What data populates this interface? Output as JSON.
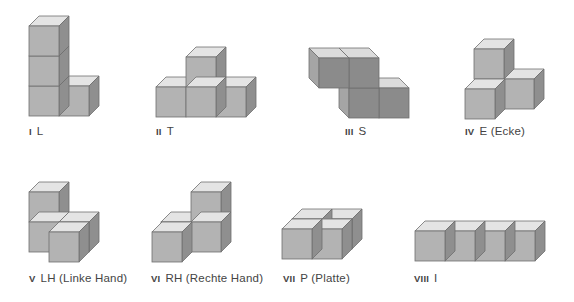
{
  "figure": {
    "title": "",
    "colors": {
      "front": "#b3b3b3",
      "top": "#e4e4e4",
      "side": "#8f8f8f",
      "edge": "#6f6f6f",
      "front_dark": "#8b8b8b",
      "top_dark": "#dcdcdc",
      "side_dark": "#a5a5a5"
    },
    "pieces": [
      {
        "numeral": "I",
        "name": "L",
        "label_x": 29,
        "label_y": 125
      },
      {
        "numeral": "II",
        "name": "T",
        "label_x": 156,
        "label_y": 125
      },
      {
        "numeral": "III",
        "name": "S",
        "label_x": 345,
        "label_y": 125
      },
      {
        "numeral": "IV",
        "name": "E (Ecke)",
        "label_x": 465,
        "label_y": 125
      },
      {
        "numeral": "V",
        "name": "LH (Linke Hand)",
        "label_x": 29,
        "label_y": 272
      },
      {
        "numeral": "VI",
        "name": "RH (Rechte Hand)",
        "label_x": 151,
        "label_y": 272
      },
      {
        "numeral": "VII",
        "name": "P (Platte)",
        "label_x": 283,
        "label_y": 272
      },
      {
        "numeral": "VIII",
        "name": "I",
        "label_x": 414,
        "label_y": 272
      }
    ]
  }
}
